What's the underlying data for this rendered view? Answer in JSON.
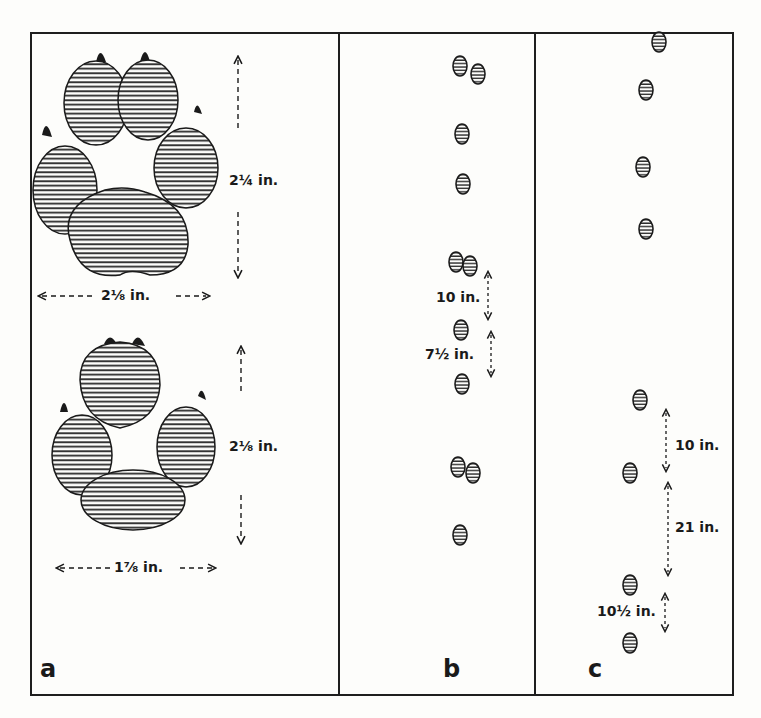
{
  "figure": {
    "panels": [
      {
        "id": "a",
        "letter": "a",
        "description": "Detailed footprints (front and hind)",
        "front_print": {
          "length_label": "2¼ in.",
          "width_label": "2⅛ in."
        },
        "hind_print": {
          "length_label": "2⅛ in.",
          "width_label": "1⅞ in."
        }
      },
      {
        "id": "b",
        "letter": "b",
        "description": "Walking track pattern",
        "measurements": [
          {
            "label": "10 in."
          },
          {
            "label": "7½ in."
          }
        ]
      },
      {
        "id": "c",
        "letter": "c",
        "description": "Trotting / running track pattern",
        "measurements": [
          {
            "label": "10 in."
          },
          {
            "label": "21 in."
          },
          {
            "label": "10½ in."
          }
        ]
      }
    ],
    "colors": {
      "ink": "#1a1a1a",
      "paper": "#fdfdfb"
    }
  }
}
